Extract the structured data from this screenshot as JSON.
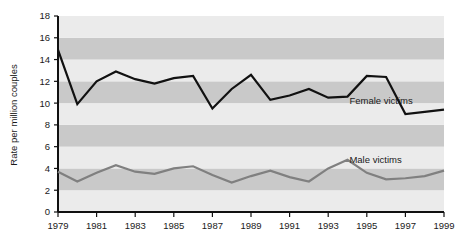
{
  "chart_data": {
    "type": "line",
    "title": "",
    "subtitle": "",
    "xlabel": "",
    "ylabel": "Rate per million couples",
    "xlim": [
      1979,
      1999
    ],
    "ylim": [
      0,
      18
    ],
    "grid": "horizontal-bands",
    "legend_position": "inline-annotation",
    "x": [
      1979,
      1980,
      1981,
      1982,
      1983,
      1984,
      1985,
      1986,
      1987,
      1988,
      1989,
      1990,
      1991,
      1992,
      1993,
      1994,
      1995,
      1996,
      1997,
      1998,
      1999
    ],
    "xtick_labels": [
      "1979",
      "1981",
      "1983",
      "1985",
      "1987",
      "1989",
      "1991",
      "1993",
      "1995",
      "1997",
      "1999"
    ],
    "xticks": [
      1979,
      1981,
      1983,
      1985,
      1987,
      1989,
      1991,
      1993,
      1995,
      1997,
      1999
    ],
    "ytick_labels": [
      "0",
      "2",
      "4",
      "6",
      "8",
      "10",
      "12",
      "14",
      "16",
      "18"
    ],
    "yticks": [
      0,
      2,
      4,
      6,
      8,
      10,
      12,
      14,
      16,
      18
    ],
    "series": [
      {
        "name": "Female victims",
        "label": "Female victims",
        "color": "#111111",
        "line_width": 2.2,
        "annotation": {
          "text": "Female victims",
          "x": 1994.1,
          "y": 9.9
        },
        "values": [
          14.9,
          9.9,
          12.0,
          12.9,
          12.2,
          11.8,
          12.3,
          12.5,
          9.5,
          11.3,
          12.6,
          10.3,
          10.7,
          11.3,
          10.5,
          10.6,
          12.5,
          12.4,
          9.0,
          9.2,
          9.4
        ]
      },
      {
        "name": "Male victims",
        "label": "Male victims",
        "color": "#808080",
        "line_width": 2.2,
        "annotation": {
          "text": "Male victims",
          "x": 1994.1,
          "y": 4.5
        },
        "values": [
          3.7,
          2.8,
          3.6,
          4.3,
          3.7,
          3.5,
          4.0,
          4.2,
          3.4,
          2.7,
          3.3,
          3.8,
          3.2,
          2.8,
          4.0,
          4.8,
          3.6,
          3.0,
          3.1,
          3.3,
          3.8
        ]
      }
    ],
    "series_corrections": {
      "female": [
        14.9,
        9.9,
        12.0,
        12.9,
        12.2,
        11.8,
        12.3,
        12.5,
        9.5,
        11.3,
        12.6,
        10.3,
        10.7,
        11.3,
        10.5,
        10.6,
        12.5,
        12.4,
        9.0,
        9.2,
        9.4
      ],
      "male": [
        3.7,
        2.8,
        3.6,
        4.3,
        3.7,
        3.5,
        4.0,
        4.2,
        3.4,
        2.7,
        3.3,
        3.8,
        3.2,
        2.8,
        4.0,
        4.8,
        3.6,
        3.0,
        3.1,
        3.3,
        3.8
      ]
    },
    "colors": {
      "band_light": "#ebebeb",
      "band_dark": "#c9c9c9",
      "axis": "#111111",
      "female_line": "#111111",
      "male_line": "#808080",
      "background": "#ffffff"
    }
  }
}
